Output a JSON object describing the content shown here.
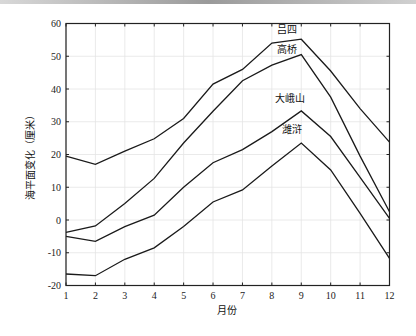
{
  "chart_data": {
    "type": "line",
    "title": "",
    "xlabel": "月份",
    "ylabel": "海平面变化（厘米）",
    "x": [
      1,
      2,
      3,
      4,
      5,
      6,
      7,
      8,
      9,
      10,
      11,
      12
    ],
    "xlim": [
      1,
      12
    ],
    "ylim": [
      -20,
      60
    ],
    "xticks": [
      1,
      2,
      3,
      4,
      5,
      6,
      7,
      8,
      9,
      10,
      11,
      12
    ],
    "yticks": [
      -20,
      -10,
      0,
      10,
      20,
      30,
      40,
      50,
      60
    ],
    "grid": true,
    "legend": "inline labels near peaks",
    "series": [
      {
        "name": "吕四",
        "values": [
          19.5,
          17,
          21,
          24.8,
          31,
          41.5,
          46,
          54,
          55.2,
          45.5,
          34,
          23.8
        ],
        "label_pos": [
          8.5,
          57
        ]
      },
      {
        "name": "高桥",
        "values": [
          -3.8,
          -1.8,
          5,
          12.7,
          23.5,
          33.2,
          42.5,
          47.3,
          50.5,
          37.5,
          19.5,
          2.5
        ],
        "label_pos": [
          8.5,
          51
        ]
      },
      {
        "name": "大峨山",
        "values": [
          -5,
          -6.5,
          -2,
          1.5,
          10,
          17.5,
          21.5,
          27,
          33.3,
          25.5,
          13,
          0.5
        ],
        "label_pos": [
          8.6,
          36
        ]
      },
      {
        "name": "潍浒",
        "values": [
          -16.5,
          -17,
          -12,
          -8.5,
          -2,
          5.5,
          9.2,
          16.5,
          23.5,
          15.3,
          2,
          -11.7
        ],
        "label_pos": [
          8.7,
          26.5
        ]
      }
    ]
  },
  "colors": {
    "line": "#1a1a1a",
    "grid": "#e4e4e4",
    "axis": "#222222"
  }
}
